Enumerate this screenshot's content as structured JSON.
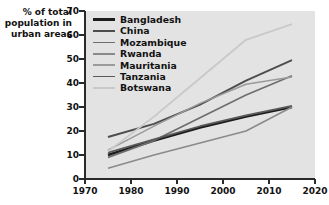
{
  "chart_data": {
    "type": "line",
    "title": "",
    "subtitle": "",
    "xlabel": "",
    "ylabel": "% of total\npopulation in\nurban areas",
    "xlim": [
      1970,
      2020
    ],
    "ylim": [
      0,
      70
    ],
    "xticks": [
      1970,
      1980,
      1990,
      2000,
      2010,
      2020
    ],
    "yticks": [
      0,
      10,
      20,
      30,
      40,
      50,
      60,
      70
    ],
    "grid": false,
    "legend_position": "top-left inside plot",
    "plot_background": "#e3e3e3",
    "series": [
      {
        "name": "Bangladesh",
        "color": "#1c1c1c",
        "width": 2.6,
        "x": [
          1975,
          1985,
          1995,
          2005,
          2015
        ],
        "values": [
          10,
          16,
          21.5,
          26,
          30
        ]
      },
      {
        "name": "China",
        "color": "#4d4d4d",
        "width": 1.9,
        "x": [
          1975,
          1985,
          1995,
          2005,
          2015
        ],
        "values": [
          17.5,
          23,
          31,
          41,
          49.5
        ]
      },
      {
        "name": "Mozambique",
        "color": "#6e6e6e",
        "width": 1.7,
        "x": [
          1975,
          1985,
          1995,
          2005,
          2015
        ],
        "values": [
          9,
          16,
          25.5,
          35,
          43
        ]
      },
      {
        "name": "Rwanda",
        "color": "#8a8a8a",
        "width": 1.5,
        "x": [
          1975,
          1985,
          1995,
          2005,
          2015
        ],
        "values": [
          4.5,
          10,
          15,
          20,
          30
        ]
      },
      {
        "name": "Mauritania",
        "color": "#9a9a9a",
        "width": 1.5,
        "x": [
          1975,
          1985,
          1995,
          2005,
          2015
        ],
        "values": [
          12,
          22,
          31.5,
          39.5,
          42.5
        ]
      },
      {
        "name": "Tanzania",
        "color": "#5a5a5a",
        "width": 1.7,
        "x": [
          1975,
          1985,
          1995,
          2005,
          2015
        ],
        "values": [
          11,
          16.5,
          22,
          26.5,
          30.5
        ]
      },
      {
        "name": "Botswana",
        "color": "#c9c9c9",
        "width": 1.8,
        "x": [
          1975,
          1985,
          1995,
          2005,
          2015
        ],
        "values": [
          11.5,
          26,
          42,
          58,
          64.5
        ]
      }
    ]
  },
  "axes": {
    "y_tick_labels": [
      "70",
      "60",
      "50",
      "40",
      "30",
      "20",
      "10",
      "0"
    ],
    "x_tick_labels": [
      "1970",
      "1980",
      "1990",
      "2000",
      "2010",
      "2020"
    ]
  }
}
